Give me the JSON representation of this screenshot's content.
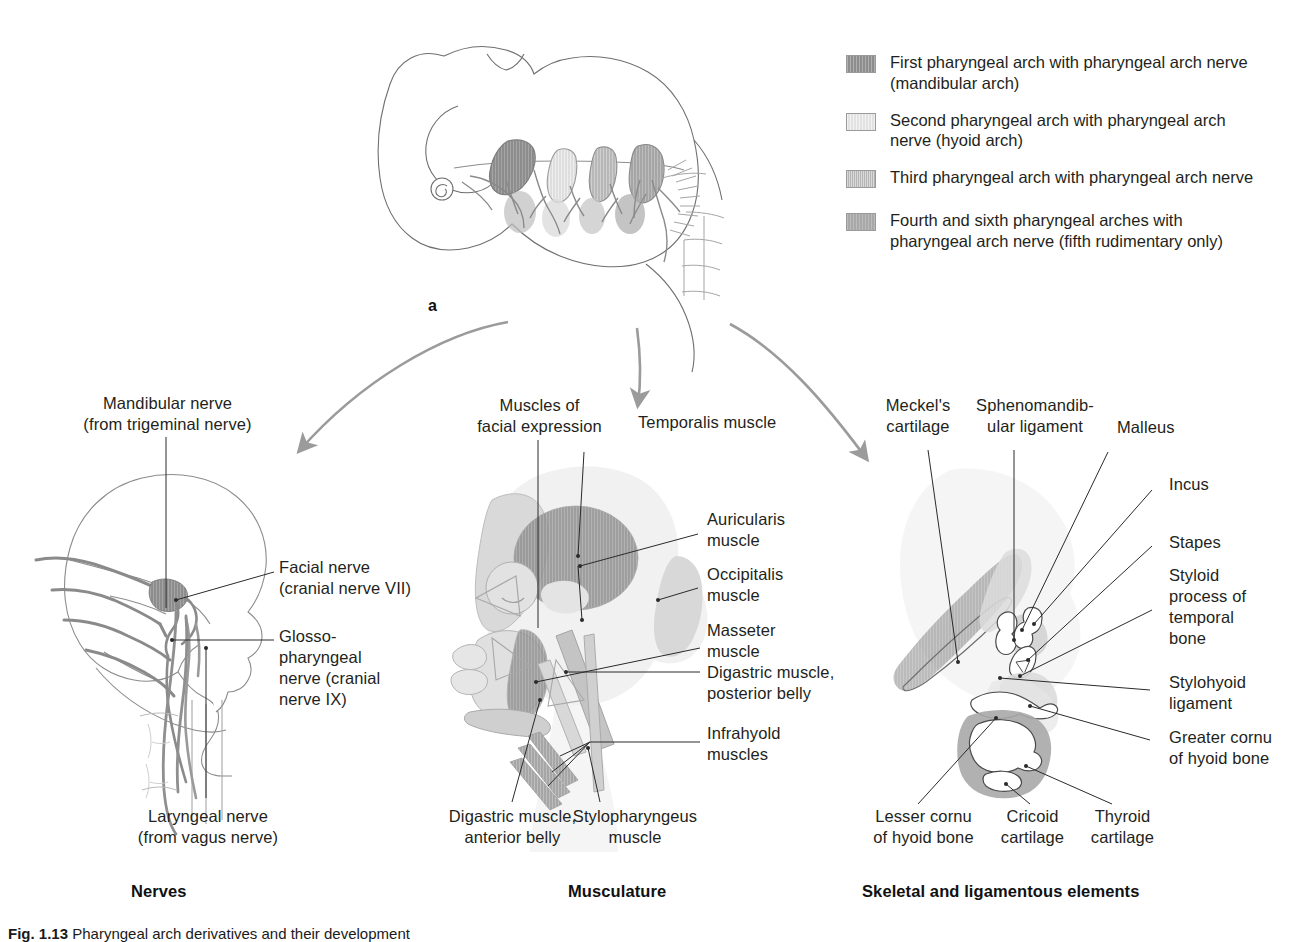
{
  "figure": {
    "panel_a_letter": "a",
    "caption_prefix": "Fig. 1.13",
    "caption_text": "Pharyngeal arch derivatives and their development"
  },
  "legend": {
    "items": [
      {
        "swatch": "first-arch-swatch",
        "color": "#8d8d8d",
        "text": "First pharyngeal arch with pharyngeal arch nerve\n(mandibular arch)"
      },
      {
        "swatch": "second-arch-swatch",
        "color": "#e2e2e2",
        "text": "Second pharyngeal arch with pharyngeal arch\nnerve (hyoid arch)"
      },
      {
        "swatch": "third-arch-swatch",
        "color": "#b4b4b4",
        "text": "Third pharyngeal arch with pharyngeal arch nerve"
      },
      {
        "swatch": "fourth-sixth-arch-swatch",
        "color": "#a8a8a8",
        "text": "Fourth and sixth pharyngeal arches with\npharyngeal arch nerve (fifth rudimentary only)"
      }
    ]
  },
  "panels": {
    "nerves": {
      "heading": "Nerves",
      "labels": {
        "mandibular": "Mandibular nerve\n(from trigeminal nerve)",
        "facial": "Facial nerve\n(cranial nerve VII)",
        "glossopharyngeal": "Glosso-\npharyngeal\nnerve (cranial\nnerve IX)",
        "laryngeal": "Laryngeal nerve\n(from vagus nerve)"
      }
    },
    "musculature": {
      "heading": "Musculature",
      "labels": {
        "facial_expression": "Muscles of\nfacial expression",
        "temporalis": "Temporalis muscle",
        "auricularis": "Auricularis\nmuscle",
        "occipitalis": "Occipitalis\nmuscle",
        "masseter": "Masseter\nmuscle",
        "digastric_posterior": "Digastric muscle,\nposterior belly",
        "infrahyoid": "Infrahyold\nmuscles",
        "digastric_anterior": "Digastric muscle,\nanterior belly",
        "stylopharyngeus": "Stylopharyngeus\nmuscle"
      }
    },
    "skeletal": {
      "heading": "Skeletal and ligamentous elements",
      "labels": {
        "meckel": "Meckel's\ncartilage",
        "sphenomandibular": "Sphenomandib-\nular ligament",
        "malleus": "Malleus",
        "incus": "Incus",
        "stapes": "Stapes",
        "styloid_process": "Styloid\nprocess of\ntemporal\nbone",
        "stylohyoid": "Stylohyoid\nligament",
        "greater_cornu": "Greater cornu\nof hyoid bone",
        "lesser_cornu": "Lesser cornu\nof hyoid bone",
        "cricoid": "Cricoid\ncartilage",
        "thyroid": "Thyroid\ncartilage"
      }
    }
  }
}
